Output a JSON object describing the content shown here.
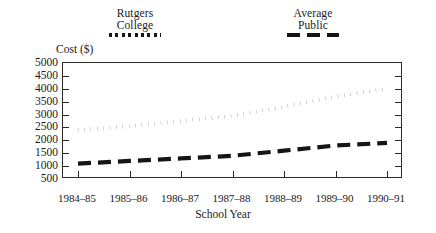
{
  "chart_data": {
    "type": "line",
    "title": "",
    "xlabel": "School Year",
    "ylabel": "Cost ($)",
    "categories": [
      "1984–85",
      "1985–86",
      "1986–87",
      "1987–88",
      "1988–89",
      "1989–90",
      "1990–91"
    ],
    "ylim": [
      500,
      5000
    ],
    "yticks": [
      500,
      1000,
      1500,
      2000,
      2500,
      3000,
      3500,
      4000,
      4500,
      5000
    ],
    "ytick_labels": [
      "500",
      "1000",
      "1500",
      "2000",
      "2500",
      "3000",
      "3500",
      "4000",
      "4500",
      "5000"
    ],
    "grid": false,
    "legend_position": "above-plot",
    "series": [
      {
        "name": "Rutgers College",
        "label_lines": [
          "Rutgers",
          "College"
        ],
        "style": "dotted",
        "color": "#151515",
        "values": [
          2400,
          2550,
          2750,
          2950,
          3300,
          3700,
          4000
        ]
      },
      {
        "name": "Average Public",
        "label_lines": [
          "Average",
          "Public"
        ],
        "style": "dashed",
        "color": "#151515",
        "values": [
          1100,
          1200,
          1300,
          1400,
          1600,
          1800,
          1900
        ]
      }
    ]
  }
}
